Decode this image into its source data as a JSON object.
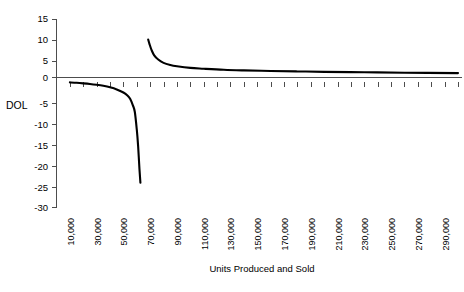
{
  "chart_data": {
    "type": "line",
    "title": "",
    "xlabel": "Units Produced and Sold",
    "ylabel": "DOL",
    "xlim": [
      0,
      300000
    ],
    "ylim": [
      -30,
      15
    ],
    "grid": false,
    "legend": null,
    "x_tick_interval": 10000,
    "y_tick_interval": 5,
    "y_ticks": [
      15,
      10,
      5,
      0,
      -5,
      -10,
      -15,
      -20,
      -25,
      -30
    ],
    "y_tick_labels": [
      "15",
      "10",
      "5",
      "0",
      "-5",
      "-10",
      "-15",
      "-20",
      "-25",
      "-30"
    ],
    "x_ticks": [
      10000,
      20000,
      30000,
      40000,
      50000,
      60000,
      70000,
      80000,
      90000,
      100000,
      110000,
      120000,
      130000,
      140000,
      150000,
      160000,
      170000,
      180000,
      190000,
      200000,
      210000,
      220000,
      230000,
      240000,
      250000,
      260000,
      270000,
      280000,
      290000,
      300000
    ],
    "x_tick_labels": [
      "10,000",
      "",
      "30,000",
      "",
      "50,000",
      "",
      "70,000",
      "",
      "90,000",
      "",
      "110,000",
      "",
      "130,000",
      "",
      "150,000",
      "",
      "170,000",
      "",
      "190,000",
      "",
      "210,000",
      "",
      "230,000",
      "",
      "250,000",
      "",
      "270,000",
      "",
      "290,000",
      ""
    ],
    "x_label_rotation": -90,
    "series": [
      {
        "name": "DOL below break-even",
        "branch": "negative",
        "x": [
          10000,
          15000,
          20000,
          25000,
          30000,
          35000,
          40000,
          45000,
          50000,
          53000,
          55000,
          57000,
          58500,
          60000,
          61000,
          62000,
          62700
        ],
        "values": [
          -0.18,
          -0.27,
          -0.4,
          -0.55,
          -0.75,
          -1.0,
          -1.35,
          -1.85,
          -2.6,
          -3.3,
          -4.1,
          -5.6,
          -7.2,
          -11.5,
          -15.5,
          -21.0,
          -24.2
        ]
      },
      {
        "name": "DOL above break-even",
        "branch": "positive",
        "x": [
          68500,
          69500,
          71000,
          73000,
          76000,
          80000,
          85000,
          90000,
          100000,
          110000,
          125000,
          140000,
          160000,
          180000,
          200000,
          230000,
          260000,
          300000
        ],
        "values": [
          10.1,
          9.0,
          7.6,
          6.3,
          5.3,
          4.5,
          4.0,
          3.7,
          3.3,
          3.1,
          2.85,
          2.7,
          2.55,
          2.45,
          2.35,
          2.25,
          2.15,
          2.05
        ]
      }
    ],
    "asymptote_note": "vertical asymptote at break-even, approximately 65,000 units"
  },
  "colors": {
    "series_line": "#000000",
    "axis": "#4d4d4d",
    "background": "#ffffff",
    "text": "#000000"
  }
}
